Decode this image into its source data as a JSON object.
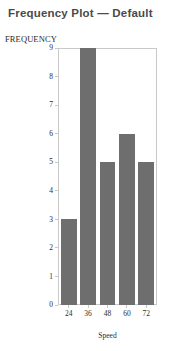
{
  "chart_data": {
    "type": "bar",
    "title": "Frequency Plot — Default",
    "xlabel": "Speed",
    "ylabel": "FREQUENCY",
    "categories": [
      "24",
      "36",
      "48",
      "60",
      "72"
    ],
    "values": [
      3,
      9,
      5,
      6,
      5
    ],
    "yticks": [
      0,
      1,
      2,
      3,
      4,
      5,
      6,
      7,
      8,
      9
    ],
    "ytick_labels": [
      "0",
      "1",
      "2",
      "3",
      "4",
      "5",
      "6",
      "7",
      "8",
      "9"
    ],
    "ylim": [
      0,
      9
    ],
    "grid": false,
    "legend": null,
    "bar_color": "#6e6e6e",
    "frame_color": "#c9c9c9",
    "title_color": "#4a4a4a",
    "text_color": "#2b2b2b",
    "background": "#ffffff"
  }
}
